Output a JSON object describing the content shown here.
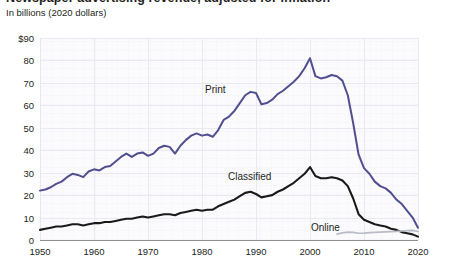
{
  "header": {
    "title_clipped": "Newspaper advertising revenue, adjusted for inflation",
    "subtitle": "In billions (2020 dollars)"
  },
  "colors": {
    "print": "#514f8f",
    "classified": "#1a1a1a",
    "online": "#b9bcc4",
    "grid": "#e9eaf1",
    "axis": "#8d8f97",
    "plot_bg": "#fbfbfd",
    "text": "#231f20"
  },
  "axes": {
    "y_label_prefix": "$",
    "y_ticks": [
      "$90",
      "80",
      "70",
      "60",
      "50",
      "40",
      "30",
      "20",
      "10",
      "0"
    ],
    "y_values": [
      90,
      80,
      70,
      60,
      50,
      40,
      30,
      20,
      10,
      0
    ],
    "x_ticks": [
      "1950",
      "1960",
      "1970",
      "1980",
      "1990",
      "2000",
      "2010",
      "2020"
    ],
    "x_values": [
      1950,
      1960,
      1970,
      1980,
      1990,
      2000,
      2010,
      2020
    ]
  },
  "series_labels": {
    "print": "Print",
    "classified": "Classified",
    "online": "Online"
  },
  "chart_data": {
    "type": "line",
    "title": "Newspaper advertising revenue, adjusted for inflation",
    "subtitle": "In billions (2020 dollars)",
    "xlabel": "",
    "ylabel": "In billions (2020 dollars)",
    "xlim": [
      1950,
      2020
    ],
    "ylim": [
      0,
      90
    ],
    "grid": true,
    "legend": "inline-labels",
    "x": [
      1950,
      1951,
      1952,
      1953,
      1954,
      1955,
      1956,
      1957,
      1958,
      1959,
      1960,
      1961,
      1962,
      1963,
      1964,
      1965,
      1966,
      1967,
      1968,
      1969,
      1970,
      1971,
      1972,
      1973,
      1974,
      1975,
      1976,
      1977,
      1978,
      1979,
      1980,
      1981,
      1982,
      1983,
      1984,
      1985,
      1986,
      1987,
      1988,
      1989,
      1990,
      1991,
      1992,
      1993,
      1994,
      1995,
      1996,
      1997,
      1998,
      1999,
      2000,
      2001,
      2002,
      2003,
      2004,
      2005,
      2006,
      2007,
      2008,
      2009,
      2010,
      2011,
      2012,
      2013,
      2014,
      2015,
      2016,
      2017,
      2018,
      2019,
      2020
    ],
    "series": [
      {
        "name": "Print",
        "color": "#514f8f",
        "values": [
          22,
          22.5,
          23.5,
          25,
          26,
          28,
          29.5,
          29,
          28,
          30.5,
          31.5,
          31,
          32.5,
          33,
          35,
          37,
          38.5,
          37,
          38.5,
          39,
          37.5,
          38.5,
          41,
          42,
          41.5,
          38.5,
          42,
          44.5,
          46.5,
          47.5,
          46.5,
          47,
          46,
          49,
          53.5,
          55,
          57.5,
          61,
          64.5,
          66,
          65.5,
          60.5,
          61,
          62.5,
          65,
          66.5,
          68.5,
          70.5,
          73,
          76.5,
          81,
          73,
          72,
          72.5,
          73.5,
          73,
          71,
          64.5,
          52,
          38,
          32,
          29.5,
          26,
          24,
          23,
          21,
          18,
          16,
          13,
          10,
          5.5
        ]
      },
      {
        "name": "Classified",
        "color": "#1a1a1a",
        "values": [
          4.5,
          5,
          5.5,
          6,
          6,
          6.5,
          7,
          7,
          6.5,
          7,
          7.5,
          7.5,
          8,
          8,
          8.5,
          9,
          9.5,
          9.5,
          10,
          10.5,
          10,
          10.5,
          11,
          11.5,
          11.5,
          11,
          12,
          12.5,
          13,
          13.5,
          13,
          13.5,
          13.5,
          15,
          16,
          17,
          18,
          19.5,
          21,
          21.5,
          20.5,
          19,
          19.5,
          20,
          21.5,
          22.5,
          24,
          25.5,
          27.5,
          29.5,
          32.5,
          28.5,
          27.5,
          27.5,
          28,
          27.5,
          26.5,
          24,
          18.5,
          11.5,
          9,
          8,
          7,
          6.5,
          6,
          5,
          4.5,
          3.5,
          3,
          2.5,
          1.5
        ]
      },
      {
        "name": "Online",
        "color": "#b9bcc4",
        "values": [
          null,
          null,
          null,
          null,
          null,
          null,
          null,
          null,
          null,
          null,
          null,
          null,
          null,
          null,
          null,
          null,
          null,
          null,
          null,
          null,
          null,
          null,
          null,
          null,
          null,
          null,
          null,
          null,
          null,
          null,
          null,
          null,
          null,
          null,
          null,
          null,
          null,
          null,
          null,
          null,
          null,
          null,
          null,
          null,
          null,
          null,
          null,
          null,
          null,
          null,
          null,
          null,
          null,
          null,
          null,
          2.6,
          3.2,
          3.5,
          3.4,
          3.0,
          3.1,
          3.3,
          3.4,
          3.5,
          3.6,
          3.7,
          3.8,
          4.0,
          4.2,
          4.3,
          3.8
        ]
      }
    ]
  }
}
